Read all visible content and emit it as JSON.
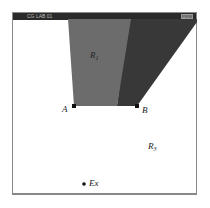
{
  "window": {
    "title": "CG LAB 01",
    "title_right": "PRIM"
  },
  "diagram": {
    "colors": {
      "region_r1": "#6e6e6e",
      "region_r2": "#3a3a3a",
      "background": "#ffffff",
      "titlebar": "#2a2a2a"
    },
    "labels": {
      "r1": "R",
      "r1_sub": "1",
      "r3": "R",
      "r3_sub": "3",
      "point_a": "A",
      "point_b": "B",
      "point_ex": "Ex"
    }
  }
}
